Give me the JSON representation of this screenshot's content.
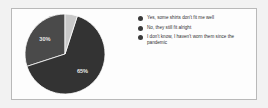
{
  "card": {
    "background_color": "#fdfdfd",
    "border_color": "#b9b9b9"
  },
  "chart_data": {
    "type": "pie",
    "title": "",
    "subtitle": "",
    "xlabel": "",
    "ylabel": "",
    "legend_position": "right",
    "grid": false,
    "categories": [
      "Yes, some shirts don't fit me well",
      "No, they still fit alright",
      "I don't know, I haven't worn them since the pandemic"
    ],
    "values": [
      30,
      65,
      5
    ],
    "data_labels": [
      "30%",
      "65%",
      ""
    ],
    "colors": [
      "#4a4a4a",
      "#333333",
      "#c9c9c9"
    ],
    "slices": [
      {
        "label": "Yes, some shirts don't fit me well",
        "value": 30,
        "data_label": "30%",
        "color": "#4a4a4a"
      },
      {
        "label": "No, they still fit alright",
        "value": 65,
        "data_label": "65%",
        "color": "#333333"
      },
      {
        "label": "I don't know, I haven't worn them since the pandemic",
        "value": 5,
        "data_label": "",
        "color": "#c9c9c9"
      }
    ]
  },
  "legend": {
    "items": [
      {
        "label": "Yes, some shirts don't fit me well",
        "color": "#3a3a3a"
      },
      {
        "label": "No, they still fit alright",
        "color": "#3a3a3a"
      },
      {
        "label": "I don't know, I haven't worn them since the pandemic",
        "color": "#3a3a3a"
      }
    ]
  },
  "pie_geometry": {
    "label_30_x": 52,
    "label_30_y": 23,
    "label_65_x": 32,
    "label_65_y": 60
  }
}
